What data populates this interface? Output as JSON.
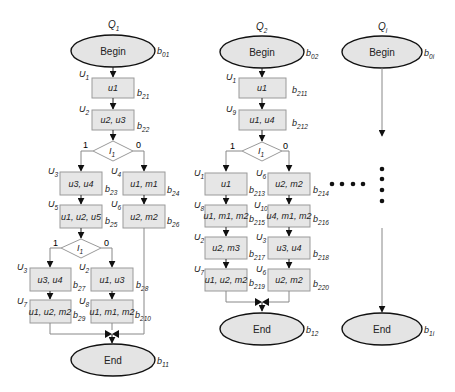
{
  "diagram": {
    "type": "flowchart",
    "queries": [
      {
        "id": "q1",
        "label": "Q",
        "label_sub": "1",
        "begin": {
          "text": "Begin",
          "tag": "b",
          "tag_sub": "01"
        },
        "end": {
          "text": "End",
          "tag": "b",
          "tag_sub": "11"
        },
        "blocks": [
          {
            "id": "b21",
            "op": "U",
            "op_sub": "1",
            "content": "u1",
            "tag": "b",
            "tag_sub": "21"
          },
          {
            "id": "b22",
            "op": "U",
            "op_sub": "2",
            "content": "u2, u3",
            "tag": "b",
            "tag_sub": "22"
          },
          {
            "id": "b23",
            "op": "U",
            "op_sub": "3",
            "content": "u3, u4",
            "tag": "b",
            "tag_sub": "23"
          },
          {
            "id": "b24",
            "op": "U",
            "op_sub": "4",
            "content": "u1, m1",
            "tag": "b",
            "tag_sub": "24"
          },
          {
            "id": "b25",
            "op": "U",
            "op_sub": "5",
            "content": "u1, u2, u5",
            "tag": "b",
            "tag_sub": "25"
          },
          {
            "id": "b26",
            "op": "U",
            "op_sub": "6",
            "content": "u2, m2",
            "tag": "b",
            "tag_sub": "26"
          },
          {
            "id": "b27",
            "op": "U",
            "op_sub": "3",
            "content": "u3, u4",
            "tag": "b",
            "tag_sub": "27"
          },
          {
            "id": "b28",
            "op": "U",
            "op_sub": "2",
            "content": "u1, u3",
            "tag": "b",
            "tag_sub": "28"
          },
          {
            "id": "b29",
            "op": "U",
            "op_sub": "7",
            "content": "u1, u2, m2",
            "tag": "b",
            "tag_sub": "29"
          },
          {
            "id": "b210",
            "op": "U",
            "op_sub": "8",
            "content": "u1, m1, m2",
            "tag": "b",
            "tag_sub": "210"
          }
        ],
        "decisions": [
          {
            "text": "I",
            "sub": "1",
            "true_label": "1",
            "false_label": "0"
          },
          {
            "text": "I",
            "sub": "1",
            "true_label": "1",
            "false_label": "0"
          }
        ]
      },
      {
        "id": "q2",
        "label": "Q",
        "label_sub": "2",
        "begin": {
          "text": "Begin",
          "tag": "b",
          "tag_sub": "02"
        },
        "end": {
          "text": "End",
          "tag": "b",
          "tag_sub": "12"
        },
        "blocks": [
          {
            "id": "b211",
            "op": "U",
            "op_sub": "1",
            "content": "u1",
            "tag": "b",
            "tag_sub": "211"
          },
          {
            "id": "b212",
            "op": "U",
            "op_sub": "9",
            "content": "u1, u4",
            "tag": "b",
            "tag_sub": "212"
          },
          {
            "id": "b213",
            "op": "U",
            "op_sub": "1",
            "content": "u1",
            "tag": "b",
            "tag_sub": "213"
          },
          {
            "id": "b214",
            "op": "U",
            "op_sub": "6",
            "content": "u2, m2",
            "tag": "b",
            "tag_sub": "214"
          },
          {
            "id": "b215",
            "op": "U",
            "op_sub": "8",
            "content": "u1, m1, m2",
            "tag": "b",
            "tag_sub": "215"
          },
          {
            "id": "b216",
            "op": "U",
            "op_sub": "10",
            "content": "u4, m1, m2",
            "tag": "b",
            "tag_sub": "216"
          },
          {
            "id": "b217",
            "op": "U",
            "op_sub": "2",
            "content": "u2, m3",
            "tag": "b",
            "tag_sub": "217"
          },
          {
            "id": "b218",
            "op": "U",
            "op_sub": "3",
            "content": "u3, u4",
            "tag": "b",
            "tag_sub": "218"
          },
          {
            "id": "b219",
            "op": "U",
            "op_sub": "7",
            "content": "u1, u2, m2",
            "tag": "b",
            "tag_sub": "219"
          },
          {
            "id": "b220",
            "op": "U",
            "op_sub": "6",
            "content": "u2, m2",
            "tag": "b",
            "tag_sub": "220"
          }
        ],
        "decisions": [
          {
            "text": "I",
            "sub": "1",
            "true_label": "1",
            "false_label": "0"
          }
        ]
      },
      {
        "id": "qi",
        "label": "Q",
        "label_sub": "i",
        "begin": {
          "text": "Begin",
          "tag": "b",
          "tag_sub": "0i"
        },
        "end": {
          "text": "End",
          "tag": "b",
          "tag_sub": "1i"
        }
      }
    ],
    "ellipsis": {
      "horizontal_dots": 4,
      "vertical_dots": 4
    }
  },
  "colors": {
    "ellipse_fill": "#e4e4e4",
    "box_fill": "#e6e6e6",
    "box_stroke": "#9a9a9a",
    "edge": "#888888",
    "arrow": "#111111"
  }
}
